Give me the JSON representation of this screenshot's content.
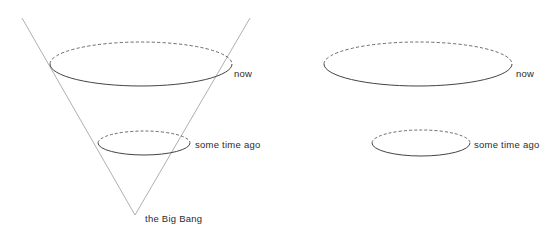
{
  "figure": {
    "background_color": "#ffffff",
    "width": 555,
    "height": 245,
    "colors": {
      "solid_arc": "#444444",
      "dashed_arc": "#5a5a5a",
      "cone_line": "#a6a6a6",
      "label_text": "#2b2b2b"
    }
  },
  "left_diagram": {
    "name": "past-light-cone",
    "apex_label": "the Big Bang",
    "surfaces": [
      {
        "name": "now-surface",
        "label": "now",
        "center_x": 141,
        "center_y": 64,
        "rx": 91,
        "ry": 22
      },
      {
        "name": "some-time-ago-surface",
        "label": "some time ago",
        "center_x": 144,
        "center_y": 143,
        "rx": 46,
        "ry": 12
      }
    ],
    "apex": {
      "x": 135,
      "y": 215
    },
    "cone_edges": [
      {
        "name": "left-cone-edge",
        "x1": 22,
        "y1": 18,
        "x2": 135,
        "y2": 215
      },
      {
        "name": "right-cone-edge",
        "x1": 250,
        "y1": 18,
        "x2": 135,
        "y2": 215
      }
    ]
  },
  "right_diagram": {
    "name": "expanding-space-slices",
    "surfaces": [
      {
        "name": "now-surface",
        "label": "now",
        "center_x": 418,
        "center_y": 64,
        "rx": 94,
        "ry": 22
      },
      {
        "name": "some-time-ago-surface",
        "label": "some time ago",
        "center_x": 421,
        "center_y": 143,
        "rx": 49,
        "ry": 13
      }
    ]
  },
  "labels": {
    "left_now": "now",
    "left_some_time_ago": "some time ago",
    "left_big_bang": "the Big Bang",
    "right_now": "now",
    "right_some_time_ago": "some time ago"
  }
}
